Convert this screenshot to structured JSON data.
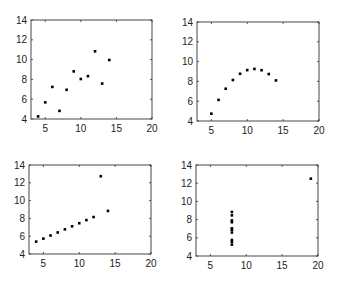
{
  "chart_data": [
    {
      "type": "scatter",
      "panel": "top-left",
      "title": "",
      "xlabel": "",
      "ylabel": "",
      "xlim": [
        3,
        20
      ],
      "ylim": [
        4,
        14
      ],
      "xticks": [
        5,
        10,
        15,
        20
      ],
      "yticks": [
        4,
        6,
        8,
        10,
        12,
        14
      ],
      "grid": false,
      "x": [
        10,
        8,
        13,
        9,
        11,
        14,
        6,
        4,
        12,
        7,
        5
      ],
      "y": [
        8.04,
        6.95,
        7.58,
        8.81,
        8.33,
        9.96,
        7.24,
        4.26,
        10.84,
        4.82,
        5.68
      ]
    },
    {
      "type": "scatter",
      "panel": "top-right",
      "title": "",
      "xlabel": "",
      "ylabel": "",
      "xlim": [
        3,
        20
      ],
      "ylim": [
        4,
        14
      ],
      "xticks": [
        5,
        10,
        15,
        20
      ],
      "yticks": [
        4,
        6,
        8,
        10,
        12,
        14
      ],
      "grid": false,
      "x": [
        10,
        8,
        13,
        9,
        11,
        14,
        6,
        4,
        12,
        7,
        5
      ],
      "y": [
        9.14,
        8.14,
        8.74,
        8.77,
        9.26,
        8.1,
        6.13,
        3.1,
        9.13,
        7.26,
        4.74
      ]
    },
    {
      "type": "scatter",
      "panel": "bottom-left",
      "title": "",
      "xlabel": "",
      "ylabel": "",
      "xlim": [
        3,
        20
      ],
      "ylim": [
        4,
        14
      ],
      "xticks": [
        5,
        10,
        15,
        20
      ],
      "yticks": [
        4,
        6,
        8,
        10,
        12,
        14
      ],
      "grid": false,
      "x": [
        10,
        8,
        13,
        9,
        11,
        14,
        6,
        4,
        12,
        7,
        5
      ],
      "y": [
        7.46,
        6.77,
        12.74,
        7.11,
        7.81,
        8.84,
        6.08,
        5.39,
        8.15,
        6.42,
        5.73
      ]
    },
    {
      "type": "scatter",
      "panel": "bottom-right",
      "title": "",
      "xlabel": "",
      "ylabel": "",
      "xlim": [
        3,
        20
      ],
      "ylim": [
        4,
        14
      ],
      "xticks": [
        5,
        10,
        15,
        20
      ],
      "yticks": [
        4,
        6,
        8,
        10,
        12,
        14
      ],
      "grid": false,
      "x": [
        8,
        8,
        8,
        8,
        8,
        8,
        8,
        19,
        8,
        8,
        8
      ],
      "y": [
        6.58,
        5.76,
        7.71,
        8.84,
        8.47,
        7.04,
        5.25,
        12.5,
        5.56,
        7.91,
        6.89
      ]
    }
  ],
  "panels": [
    {
      "name": "top-left",
      "box": {
        "left": 31,
        "top": 20,
        "right": 152,
        "bottom": 119
      }
    },
    {
      "name": "top-right",
      "box": {
        "left": 197,
        "top": 22,
        "right": 319,
        "bottom": 121
      }
    },
    {
      "name": "bottom-left",
      "box": {
        "left": 29,
        "top": 165,
        "right": 151,
        "bottom": 254
      }
    },
    {
      "name": "bottom-right",
      "box": {
        "left": 196,
        "top": 165,
        "right": 318,
        "bottom": 256
      }
    }
  ]
}
